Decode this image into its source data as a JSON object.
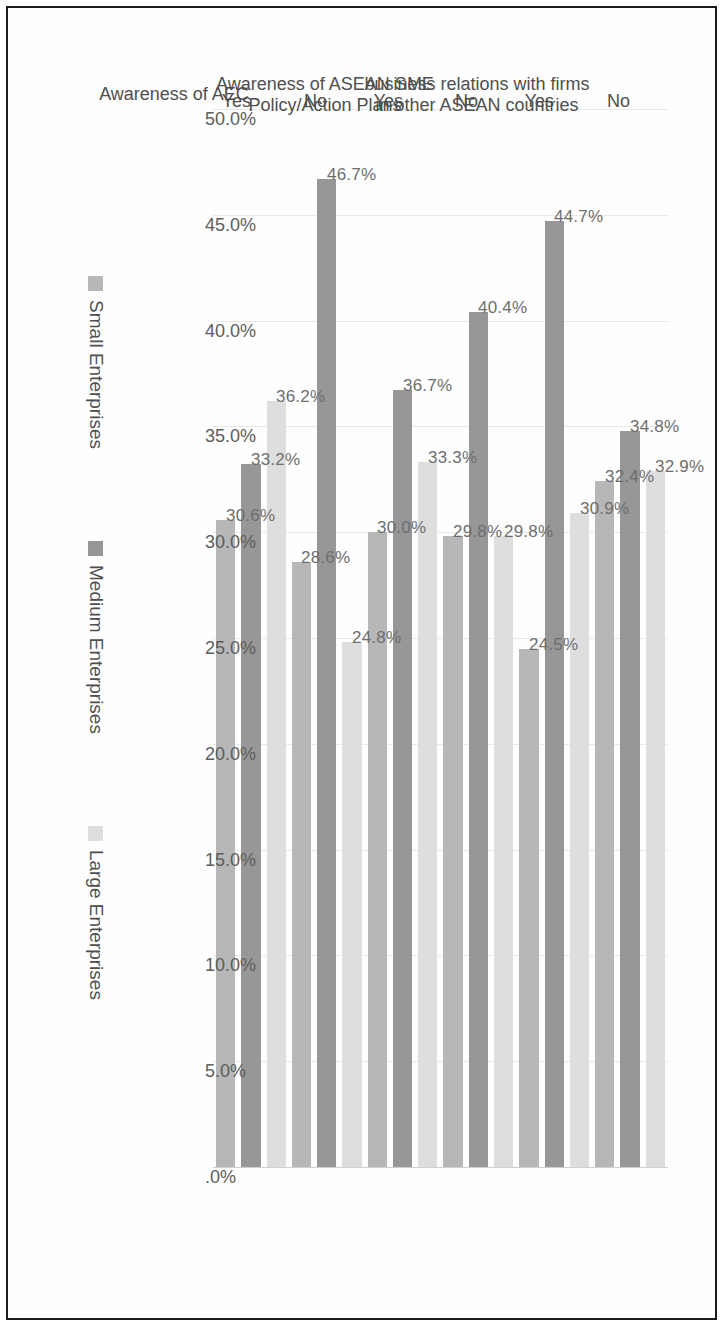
{
  "chart_data": {
    "type": "bar",
    "orientation": "horizontal",
    "title": "",
    "xlabel": "",
    "ylabel": "",
    "grid": true,
    "legend_position": "bottom",
    "value_axis": {
      "ticks": [
        "50.0%",
        "45.0%",
        "40.0%",
        "35.0%",
        "30.0%",
        "25.0%",
        "20.0%",
        "15.0%",
        "10.0%",
        "5.0%",
        ".0%"
      ],
      "min": 0,
      "max": 50
    },
    "group_titles": [
      "business relations with firms in other ASEAN countries",
      "Awareness of ASEAN SME Policy/Action Plans",
      "Awareness of AEC"
    ],
    "categories": [
      "No",
      "Yes",
      "No",
      "Yes",
      "No",
      "Yes"
    ],
    "series": [
      {
        "name": "Small Enterprises",
        "color": "#b7b7b7",
        "values": [
          32.4,
          24.5,
          29.8,
          30.0,
          28.6,
          30.6
        ],
        "labels": [
          "32.4%",
          "24.5%",
          "29.8%",
          "30.0%",
          "28.6%",
          "30.6%"
        ]
      },
      {
        "name": "Medium Enterprises",
        "color": "#979797",
        "values": [
          34.8,
          44.7,
          40.4,
          36.7,
          46.7,
          33.2
        ],
        "labels": [
          "34.8%",
          "44.7%",
          "40.4%",
          "36.7%",
          "46.7%",
          "33.2%"
        ]
      },
      {
        "name": "Large Enterprises",
        "color": "#dedede",
        "values": [
          32.9,
          30.9,
          29.8,
          33.3,
          24.8,
          36.2
        ],
        "labels": [
          "32.9%",
          "30.9%",
          "29.8%",
          "33.3%",
          "24.8%",
          "36.2%"
        ]
      }
    ]
  },
  "legend": {
    "items": [
      {
        "label": "Small Enterprises",
        "key": "small"
      },
      {
        "label": "Medium Enterprises",
        "key": "medium"
      },
      {
        "label": "Large Enterprises",
        "key": "large"
      }
    ]
  }
}
